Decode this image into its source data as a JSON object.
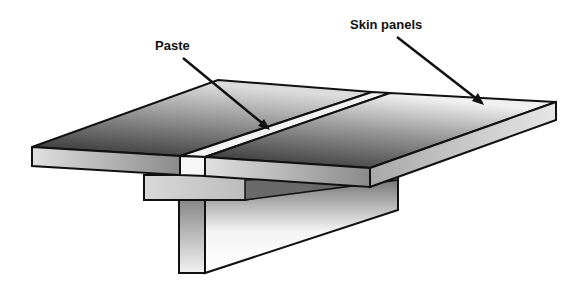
{
  "diagram": {
    "labels": [
      {
        "id": "paste",
        "text": "Paste"
      },
      {
        "id": "skin-panels",
        "text": "Skin panels"
      }
    ],
    "colors": {
      "outline": "#111111",
      "panel_dark": "#3a3a3a",
      "panel_light": "#e8e8e8",
      "paste": "#f2f2f2"
    }
  }
}
